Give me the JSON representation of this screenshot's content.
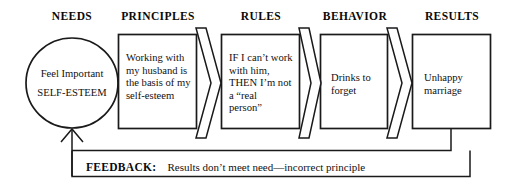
{
  "diagram": {
    "stroke_color": "#1a1a1a",
    "background_color": "#ffffff",
    "columns": [
      {
        "id": "needs",
        "header": "NEEDS"
      },
      {
        "id": "principles",
        "header": "PRINCIPLES"
      },
      {
        "id": "rules",
        "header": "RULES"
      },
      {
        "id": "behavior",
        "header": "BEHAVIOR"
      },
      {
        "id": "results",
        "header": "RESULTS"
      }
    ],
    "nodes": [
      {
        "id": "needs",
        "shape": "ellipse",
        "line1": "Feel Important",
        "line2": "SELF-ESTEEM"
      },
      {
        "id": "principles",
        "shape": "rect",
        "text": "Working with\nmy husband is\nthe basis of my\nself-esteem"
      },
      {
        "id": "rules",
        "shape": "rect",
        "text": "IF I can’t work\nwith him,\nTHEN I’m not\na “real\nperson”"
      },
      {
        "id": "behavior",
        "shape": "rect",
        "text": "Drinks to\nforget"
      },
      {
        "id": "results",
        "shape": "rect",
        "text": "Unhappy\nmarriage"
      }
    ],
    "arrows": [
      {
        "id": "principles-to-rules",
        "direction": "right"
      },
      {
        "id": "rules-to-behavior",
        "direction": "right"
      },
      {
        "id": "behavior-to-results",
        "direction": "right"
      }
    ],
    "feedback": {
      "label": "FEEDBACK:",
      "text": "Results don’t meet need—incorrect principle",
      "arrow_direction": "up-into-needs"
    }
  }
}
